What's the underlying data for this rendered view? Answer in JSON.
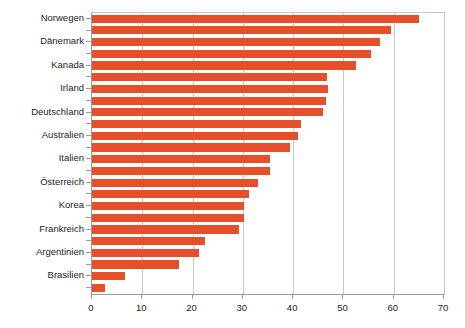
{
  "chart_data": {
    "type": "bar",
    "orientation": "horizontal",
    "title": "",
    "subtitle": "",
    "xlabel": "",
    "ylabel": "",
    "xlim": [
      0,
      70
    ],
    "ylim": null,
    "xticks": [
      0,
      10,
      20,
      30,
      40,
      50,
      60,
      70
    ],
    "xtick_labels": [
      "0",
      "10",
      "20",
      "30",
      "40",
      "50",
      "60",
      "70"
    ],
    "grid": "vertical",
    "legend": null,
    "legend_position": "none",
    "bar_color": "#E5502A",
    "categories": [
      "Norwegen",
      "Dänemark",
      "Kanada",
      "Irland",
      "Deutschland",
      "Australien",
      "Italien",
      "Österreich",
      "Korea",
      "Frankreich",
      "Argentinien",
      "Brasilien"
    ],
    "series": [
      {
        "name": "series-1",
        "values": [
          65.0,
          57.3,
          52.5,
          47.0,
          46.0,
          41.0,
          35.3,
          33.0,
          30.3,
          29.3,
          21.2,
          6.5
        ]
      },
      {
        "name": "series-2",
        "values": [
          59.4,
          55.5,
          46.8,
          46.5,
          41.5,
          39.4,
          35.4,
          31.2,
          30.3,
          22.5,
          17.4,
          2.5
        ]
      }
    ],
    "bars": [
      {
        "category": "Norwegen",
        "series": "series-1",
        "value": 65.0
      },
      {
        "category": "Norwegen",
        "series": "series-2",
        "value": 59.4
      },
      {
        "category": "Dänemark",
        "series": "series-1",
        "value": 57.3
      },
      {
        "category": "Dänemark",
        "series": "series-2",
        "value": 55.5
      },
      {
        "category": "Kanada",
        "series": "series-1",
        "value": 52.5
      },
      {
        "category": "Kanada",
        "series": "series-2",
        "value": 46.8
      },
      {
        "category": "Irland",
        "series": "series-1",
        "value": 47.0
      },
      {
        "category": "Irland",
        "series": "series-2",
        "value": 46.5
      },
      {
        "category": "Deutschland",
        "series": "series-1",
        "value": 46.0
      },
      {
        "category": "Deutschland",
        "series": "series-2",
        "value": 41.5
      },
      {
        "category": "Australien",
        "series": "series-1",
        "value": 41.0
      },
      {
        "category": "Australien",
        "series": "series-2",
        "value": 39.4
      },
      {
        "category": "Italien",
        "series": "series-1",
        "value": 35.3
      },
      {
        "category": "Italien",
        "series": "series-2",
        "value": 35.4
      },
      {
        "category": "Österreich",
        "series": "series-1",
        "value": 33.0
      },
      {
        "category": "Österreich",
        "series": "series-2",
        "value": 31.2
      },
      {
        "category": "Korea",
        "series": "series-1",
        "value": 30.3
      },
      {
        "category": "Korea",
        "series": "series-2",
        "value": 30.3
      },
      {
        "category": "Frankreich",
        "series": "series-1",
        "value": 29.3
      },
      {
        "category": "Frankreich",
        "series": "series-2",
        "value": 22.5
      },
      {
        "category": "Argentinien",
        "series": "series-1",
        "value": 21.2
      },
      {
        "category": "Argentinien",
        "series": "series-2",
        "value": 17.4
      },
      {
        "category": "Brasilien",
        "series": "series-1",
        "value": 6.5
      },
      {
        "category": "Brasilien",
        "series": "series-2",
        "value": 2.5
      }
    ]
  }
}
